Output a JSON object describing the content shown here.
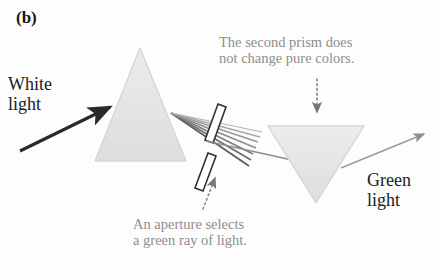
{
  "figure": {
    "panel_label": "(b)",
    "background_color": "#fdfdfd",
    "width": 438,
    "height": 280
  },
  "labels": {
    "white_light": "White\nlight",
    "green_light": "Green\nlight"
  },
  "annotations": {
    "second_prism": "The second prism does\nnot change pure colors.",
    "aperture": "An aperture selects\na green ray of light."
  },
  "colors": {
    "prism_fill": "#e6e6e6",
    "prism_edge": "#d2d2d2",
    "annotation_text": "#8e8e8e",
    "label_text": "#1b1b1b",
    "arrow_dark": "#2a2a2a",
    "arrow_gray": "#9a9a9a",
    "aperture_bar": "#3a3a3a",
    "ray_gray": "#707070"
  },
  "elements": {
    "prism_one": "upright-triangular-prism",
    "prism_two": "inverted-triangular-prism",
    "aperture": "two-bar-slit-aperture",
    "dispersed_fan": "fan-of-refracted-rays",
    "selected_ray": "single-green-ray",
    "white_light_arrow": "incoming-white-light-arrow",
    "green_light_arrow": "outgoing-green-light-arrow",
    "annotation_pointer_top": "dotted-arrow-down",
    "annotation_pointer_bottom": "dotted-arrow-up"
  }
}
